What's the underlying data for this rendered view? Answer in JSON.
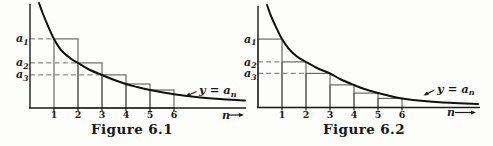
{
  "page": {
    "background": "#fdfdfb",
    "ink_color": "#1b1b1b",
    "curve_color": "#111111",
    "rect_line_color": "#5d5d5d",
    "dash_color": "#8c8c8c"
  },
  "figures": [
    {
      "caption": "Figure 6.1",
      "y_axis_value_labels": [
        {
          "base": "a",
          "sub": "1"
        },
        {
          "base": "a",
          "sub": "2"
        },
        {
          "base": "a",
          "sub": "3"
        }
      ],
      "x_tick_labels": [
        "1",
        "2",
        "3",
        "4",
        "5",
        "6"
      ],
      "x_axis_label": "n",
      "curve_label": {
        "prefix": "y = a",
        "sub": "n"
      }
    },
    {
      "caption": "Figure 6.2",
      "y_axis_value_labels": [
        {
          "base": "a",
          "sub": "1"
        },
        {
          "base": "a",
          "sub": "2"
        },
        {
          "base": "a",
          "sub": "3"
        }
      ],
      "x_tick_labels": [
        "1",
        "2",
        "3",
        "4",
        "5",
        "6"
      ],
      "x_axis_label": "n",
      "curve_label": {
        "prefix": "y = a",
        "sub": "n"
      }
    }
  ],
  "chart_data": [
    {
      "type": "line",
      "title": "Figure 6.1",
      "xlabel": "n",
      "ylabel": "",
      "grid": false,
      "x_ticks": [
        1,
        2,
        3,
        4,
        5,
        6
      ],
      "x_range": [
        0,
        9
      ],
      "y_range": [
        0,
        4.4
      ],
      "curve": {
        "label": "y = a_n",
        "points": [
          [
            0.375,
            4.375
          ],
          [
            0.542,
            3.917
          ],
          [
            0.75,
            3.417
          ],
          [
            1,
            2.875
          ],
          [
            1.292,
            2.417
          ],
          [
            1.667,
            2.083
          ],
          [
            2,
            1.875
          ],
          [
            2.458,
            1.604
          ],
          [
            3,
            1.375
          ],
          [
            3.458,
            1.188
          ],
          [
            4,
            1.0
          ],
          [
            4.458,
            0.875
          ],
          [
            5,
            0.75
          ],
          [
            5.5,
            0.654
          ],
          [
            6,
            0.571
          ],
          [
            6.917,
            0.458
          ],
          [
            7.917,
            0.375
          ],
          [
            8.958,
            0.313
          ]
        ]
      },
      "a_values": {
        "a1": 2.88,
        "a2": 1.88,
        "a3": 1.38,
        "a4": 1.0,
        "a5": 0.75,
        "a6": 0.57
      },
      "rectangles": [
        {
          "x0": 1,
          "x1": 2,
          "height": 2.88
        },
        {
          "x0": 2,
          "x1": 3,
          "height": 1.88
        },
        {
          "x0": 3,
          "x1": 4,
          "height": 1.38
        },
        {
          "x0": 4,
          "x1": 5,
          "height": 1.0
        },
        {
          "x0": 5,
          "x1": 6,
          "height": 0.75
        }
      ],
      "dashed_guides": [
        {
          "level": 2.88,
          "from_x": 0,
          "to_x": 1,
          "label": "a_1"
        },
        {
          "level": 1.88,
          "from_x": 0,
          "to_x": 2,
          "label": "a_2"
        },
        {
          "level": 1.38,
          "from_x": 0,
          "to_x": 3,
          "label": "a_3"
        }
      ],
      "y_label_levels": [
        2.88,
        1.88,
        1.38
      ]
    },
    {
      "type": "line",
      "title": "Figure 6.2",
      "xlabel": "n",
      "ylabel": "",
      "grid": false,
      "x_ticks": [
        1,
        2,
        3,
        4,
        5,
        6
      ],
      "x_range": [
        0,
        9.3
      ],
      "y_range": [
        0,
        4.3
      ],
      "curve": {
        "label": "y = a_n",
        "points": [
          [
            0.375,
            4.271
          ],
          [
            0.542,
            3.813
          ],
          [
            0.75,
            3.354
          ],
          [
            1,
            2.854
          ],
          [
            1.292,
            2.438
          ],
          [
            1.625,
            2.125
          ],
          [
            2,
            1.896
          ],
          [
            2.458,
            1.646
          ],
          [
            3,
            1.417
          ],
          [
            3.458,
            1.167
          ],
          [
            4,
            0.938
          ],
          [
            4.5,
            0.75
          ],
          [
            5,
            0.604
          ],
          [
            5.5,
            0.479
          ],
          [
            6,
            0.375
          ],
          [
            6.917,
            0.271
          ],
          [
            8,
            0.196
          ],
          [
            9.167,
            0.146
          ]
        ]
      },
      "a_values": {
        "a1": 2.85,
        "a2": 1.9,
        "a3": 1.42,
        "a4": 0.94,
        "a5": 0.6,
        "a6": 0.38
      },
      "rectangles": [
        {
          "x0": 0,
          "x1": 1,
          "height": 2.85
        },
        {
          "x0": 1,
          "x1": 2,
          "height": 1.9
        },
        {
          "x0": 2,
          "x1": 3,
          "height": 1.42
        },
        {
          "x0": 3,
          "x1": 4,
          "height": 0.94
        },
        {
          "x0": 4,
          "x1": 5,
          "height": 0.6
        },
        {
          "x0": 5,
          "x1": 6,
          "height": 0.38
        }
      ],
      "dashed_guides": [
        {
          "level": 1.9,
          "from_x": 0,
          "to_x": 1,
          "label": "a_2"
        },
        {
          "level": 1.42,
          "from_x": 0,
          "to_x": 2,
          "label": "a_3"
        }
      ],
      "y_label_levels": [
        2.85,
        1.9,
        1.42
      ]
    }
  ]
}
